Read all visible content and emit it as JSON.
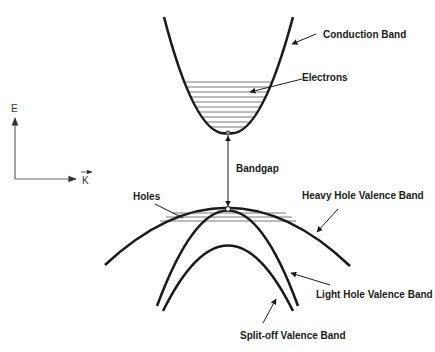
{
  "diagram": {
    "axes": {
      "y_label": "E",
      "x_label": "K"
    },
    "labels": {
      "conduction_band": "Conduction Band",
      "electrons": "Electrons",
      "bandgap": "Bandgap",
      "holes": "Holes",
      "heavy_hole": "Heavy Hole Valence Band",
      "light_hole": "Light Hole Valence Band",
      "split_off": "Split-off Valence Band"
    },
    "colors": {
      "curve": "#1a1a1a",
      "hatch": "#555555",
      "axis": "#666666"
    }
  }
}
